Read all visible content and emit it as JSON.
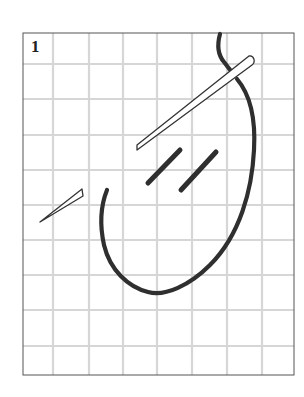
{
  "figure": {
    "step_number": "1",
    "colors": {
      "grid": "#d6d6d6",
      "frame": "#555555",
      "thread": "#2f2f2f",
      "needle_outline": "#333333",
      "background": "#ffffff"
    },
    "grid": {
      "frame": {
        "x1": 23,
        "y1": 33,
        "x2": 294,
        "y2": 375
      },
      "vertical_lines": [
        53,
        89,
        123,
        157,
        192,
        227,
        262
      ],
      "horizontal_lines": [
        64,
        99,
        135,
        170,
        205,
        240,
        275,
        310,
        346
      ]
    }
  }
}
